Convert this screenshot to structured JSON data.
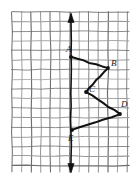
{
  "figure": {
    "kind": "hand-drawn-graph-paper-diagram",
    "background_color": "#ffffff",
    "grid": {
      "line_color": "#9a9a9a",
      "major_line_color": "#6e6e6e",
      "cell_size_px": 9.6,
      "left_px": 12,
      "top_px": 12,
      "right_px": 129,
      "bottom_px": 172,
      "columns": 12,
      "rows": 17,
      "major_every": 1
    },
    "axis": {
      "name": "vertical-axis",
      "color": "#111111",
      "x_px": 71,
      "top_px": 12,
      "bottom_px": 174,
      "arrow_top": true,
      "arrow_bottom": true,
      "stroke_width": 1.6
    },
    "polyline": {
      "name": "zigzag-path",
      "color": "#111111",
      "stroke_width": 2.0,
      "closed": false,
      "vertex_dot_radius_px": 1.9,
      "vertices": [
        {
          "id": "A",
          "label": "A",
          "x_px": 71,
          "y_px": 57,
          "label_x_px": 66,
          "label_y_px": 45
        },
        {
          "id": "B",
          "label": "B",
          "x_px": 108,
          "y_px": 68,
          "label_x_px": 111,
          "label_y_px": 59
        },
        {
          "id": "C",
          "label": "C",
          "x_px": 86,
          "y_px": 92,
          "label_x_px": 89,
          "label_y_px": 85
        },
        {
          "id": "D",
          "label": "D",
          "x_px": 120,
          "y_px": 114,
          "label_x_px": 121,
          "label_y_px": 100
        },
        {
          "id": "E",
          "label": "E",
          "x_px": 72,
          "y_px": 130,
          "label_x_px": 68,
          "label_y_px": 134
        }
      ],
      "segments": [
        {
          "from": "A",
          "to": "B"
        },
        {
          "from": "B",
          "to": "C"
        },
        {
          "from": "C",
          "to": "D"
        },
        {
          "from": "D",
          "to": "E"
        }
      ]
    }
  }
}
